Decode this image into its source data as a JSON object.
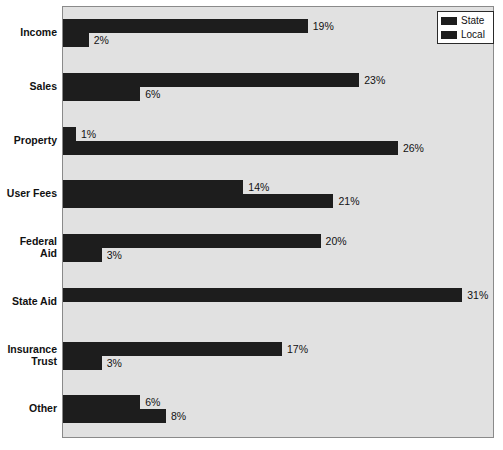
{
  "chart_data": {
    "type": "bar",
    "orientation": "horizontal",
    "title": "",
    "xlabel": "",
    "ylabel": "",
    "xlim": [
      0,
      33
    ],
    "grid": false,
    "legend_position": "top-right",
    "categories": [
      "Income",
      "Sales",
      "Property",
      "User Fees",
      "Federal\nAid",
      "State Aid",
      "Insurance\nTrust",
      "Other"
    ],
    "series": [
      {
        "name": "State",
        "values": [
          19,
          23,
          1,
          14,
          20,
          31,
          17,
          6
        ],
        "labels": [
          "19%",
          "23%",
          "1%",
          "14%",
          "20%",
          "31%",
          "17%",
          "6%"
        ],
        "color": "#1d1d1d"
      },
      {
        "name": "Local",
        "values": [
          2,
          6,
          26,
          21,
          3,
          0,
          3,
          8
        ],
        "labels": [
          "2%",
          "6%",
          "26%",
          "21%",
          "3%",
          "",
          "3%",
          "8%"
        ],
        "color": "#1d1d1d"
      }
    ]
  },
  "legend": {
    "items": [
      {
        "label": "State",
        "color": "#1d1d1d"
      },
      {
        "label": "Local",
        "color": "#1d1d1d"
      }
    ]
  },
  "colors": {
    "bar": "#1d1d1d",
    "plot_background": "#e1e1e1",
    "plot_border": "#8a8a8a",
    "page_background": "#ffffff",
    "text": "#111111"
  }
}
